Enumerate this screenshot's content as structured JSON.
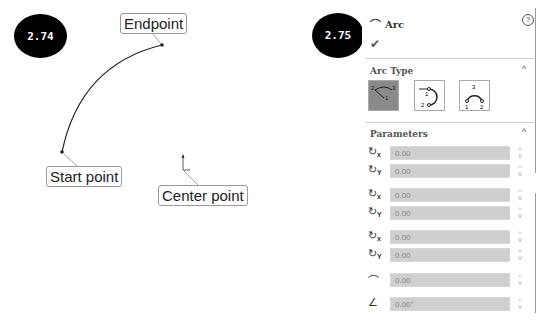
{
  "figure_left": {
    "badge": "2.74",
    "labels": {
      "endpoint": "Endpoint",
      "start_point": "Start point",
      "center_point": "Center point"
    }
  },
  "figure_right": {
    "badge": "2.75",
    "panel": {
      "title": "Arc",
      "help_icon": "?",
      "ok_icon": "✔",
      "arc_type": {
        "title": "Arc Type",
        "options": [
          {
            "name": "center-point-arc",
            "active": true
          },
          {
            "name": "tangent-arc",
            "active": false
          },
          {
            "name": "3-point-arc",
            "active": false
          }
        ]
      },
      "parameters": {
        "title": "Parameters",
        "rows": [
          {
            "icon": "center-x",
            "sub": "x",
            "value": "0.00"
          },
          {
            "icon": "center-y",
            "sub": "Y",
            "value": "0.00"
          },
          {
            "icon": "start-x",
            "sub": "x",
            "value": "0.00"
          },
          {
            "icon": "start-y",
            "sub": "Y",
            "value": "0.00"
          },
          {
            "icon": "end-x",
            "sub": "x",
            "value": "0.00"
          },
          {
            "icon": "end-y",
            "sub": "Y",
            "value": "0.00"
          },
          {
            "icon": "radius",
            "sub": "",
            "value": "0.00"
          },
          {
            "icon": "angle",
            "sub": "",
            "value": "0.00°"
          }
        ]
      }
    }
  }
}
